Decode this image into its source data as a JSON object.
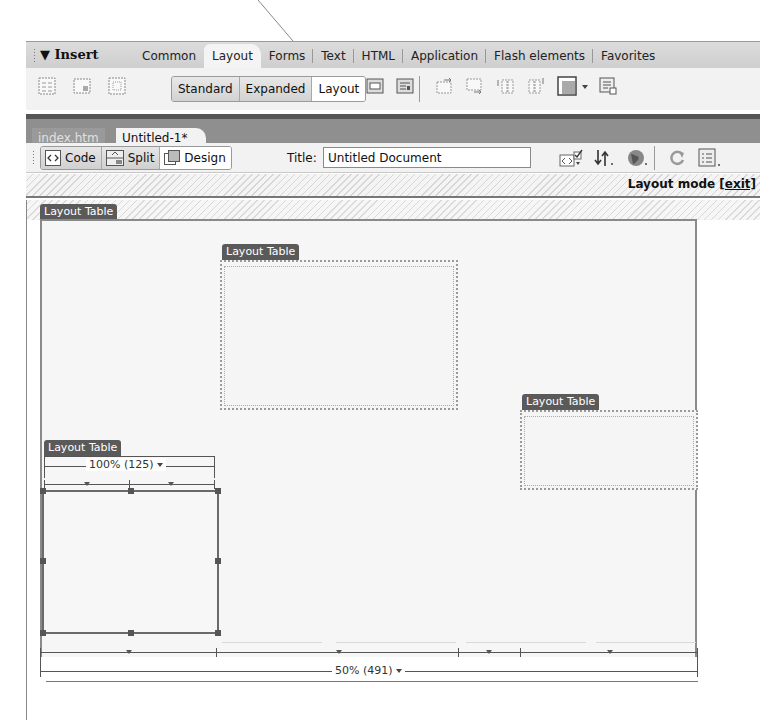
{
  "insert_panel": {
    "title": "▼ Insert",
    "tabs": [
      {
        "label": "Common",
        "active": false
      },
      {
        "label": "Layout",
        "active": true
      },
      {
        "label": "Forms",
        "active": false
      },
      {
        "label": "Text",
        "active": false
      },
      {
        "label": "HTML",
        "active": false
      },
      {
        "label": "Application",
        "active": false
      },
      {
        "label": "Flash elements",
        "active": false
      },
      {
        "label": "Favorites",
        "active": false
      }
    ],
    "toolbar": {
      "left_icons": [
        "table-icon",
        "insert-div-icon",
        "draw-ap-div-icon"
      ],
      "mode_buttons": [
        {
          "label": "Standard",
          "active": false
        },
        {
          "label": "Expanded",
          "active": false
        },
        {
          "label": "Layout",
          "active": true
        }
      ],
      "right_icons": [
        "layout-table-icon",
        "draw-layout-cell-icon",
        "insert-row-above-icon",
        "insert-row-below-icon",
        "insert-column-left-icon",
        "insert-column-right-icon",
        "frames-icon",
        "tabular-data-icon"
      ]
    }
  },
  "document": {
    "tabs": [
      {
        "label": "index.htm",
        "active": false
      },
      {
        "label": "Untitled-1*",
        "active": true
      }
    ],
    "toolbar": {
      "views": [
        {
          "label": "Code",
          "icon": "code-view-icon",
          "active": false
        },
        {
          "label": "Split",
          "icon": "split-view-icon",
          "active": false
        },
        {
          "label": "Design",
          "icon": "design-view-icon",
          "active": true
        }
      ],
      "title_label": "Title:",
      "title_value": "Untitled Document",
      "icons": [
        "validate-markup-icon",
        "file-management-icon",
        "preview-browser-icon",
        "refresh-icon",
        "view-options-icon"
      ]
    },
    "layout_mode": {
      "label": "Layout mode",
      "exit_link": "[exit]"
    }
  },
  "canvas": {
    "layout_tables": [
      {
        "tag": "Layout Table",
        "role": "outer"
      },
      {
        "tag": "Layout Table",
        "role": "top-middle"
      },
      {
        "tag": "Layout Table",
        "role": "right"
      },
      {
        "tag": "Layout Table",
        "role": "bottom-left"
      }
    ],
    "inner_width_label": "100% (125)",
    "outer_width_label": "50% (491)"
  }
}
